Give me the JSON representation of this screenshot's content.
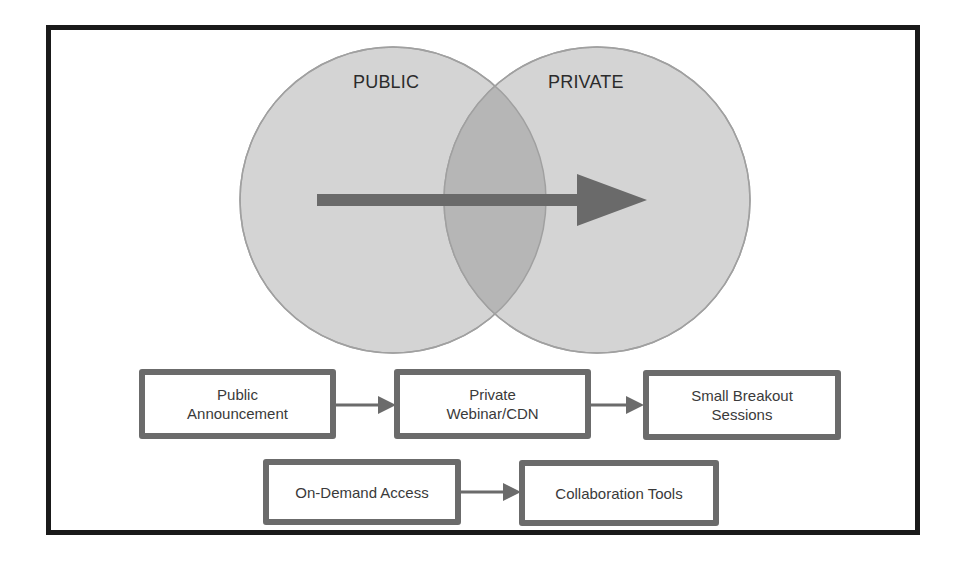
{
  "diagram": {
    "venn": {
      "circles": [
        {
          "label": "PUBLIC",
          "fill": "#d2d2d2",
          "stroke": "#9a9a9a"
        },
        {
          "label": "PRIVATE",
          "fill": "#d2d2d2",
          "stroke": "#9a9a9a"
        }
      ],
      "overlap_fill": "#b4b4b4",
      "arrow": {
        "direction": "public-to-private",
        "color": "#6a6a6a"
      }
    },
    "flow_row_1": [
      {
        "line1": "Public",
        "line2": "Announcement"
      },
      {
        "line1": "Private",
        "line2": "Webinar/CDN"
      },
      {
        "line1": "Small Breakout",
        "line2": "Sessions"
      }
    ],
    "flow_row_2": [
      {
        "line1": "On-Demand Access"
      },
      {
        "line1": "Collaboration Tools"
      }
    ],
    "colors": {
      "frame_border": "#1a1a1a",
      "box_border": "#6b6b6b",
      "text": "#3a3a3a",
      "connector": "#6b6b6b"
    }
  }
}
